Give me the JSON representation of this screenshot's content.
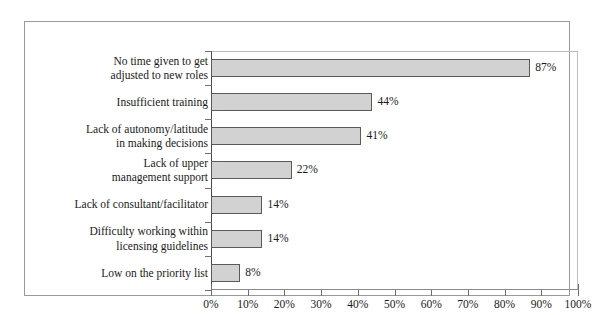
{
  "chart_data": {
    "type": "bar",
    "orientation": "horizontal",
    "title": "",
    "xlabel": "",
    "ylabel": "",
    "xlim": [
      0,
      100
    ],
    "xticks": [
      "0%",
      "10%",
      "20%",
      "30%",
      "40%",
      "50%",
      "60%",
      "70%",
      "80%",
      "90%",
      "100%"
    ],
    "xtick_values": [
      0,
      10,
      20,
      30,
      40,
      50,
      60,
      70,
      80,
      90,
      100
    ],
    "grid": false,
    "legend": "none",
    "categories": [
      "No time given to get\nadjusted to new roles",
      "Insufficient training",
      "Lack of autonomy/latitude\nin making decisions",
      "Lack of upper\nmanagement support",
      "Lack of consultant/facilitator",
      "Difficulty working within\nlicensing guidelines",
      "Low on the priority list"
    ],
    "values": [
      87,
      44,
      41,
      22,
      14,
      14,
      8
    ],
    "data_labels": [
      "87%",
      "44%",
      "41%",
      "22%",
      "14%",
      "14%",
      "8%"
    ],
    "colors": {
      "bar_fill": "#d2d2d2",
      "bar_border": "#5a5a5a",
      "axis": "#6e6e6e",
      "text": "#1a1a1a",
      "frame": "#9a9a9a",
      "background": "#ffffff"
    }
  }
}
